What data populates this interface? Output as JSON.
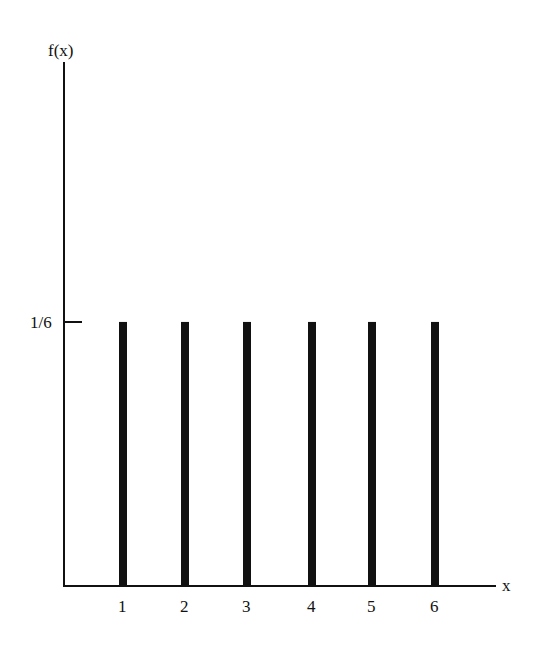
{
  "chart_data": {
    "type": "bar",
    "title": "",
    "xlabel": "x",
    "ylabel": "f(x)",
    "categories": [
      "1",
      "2",
      "3",
      "4",
      "5",
      "6"
    ],
    "values": [
      0.1667,
      0.1667,
      0.1667,
      0.1667,
      0.1667,
      0.1667
    ],
    "y_tick_labels": [
      "1/6"
    ],
    "x_tick_labels": [
      "1",
      "2",
      "3",
      "4",
      "5",
      "6"
    ],
    "ylim": [
      0,
      0.4
    ],
    "grid": false,
    "legend": null
  },
  "axes": {
    "y_label": "f(x)",
    "x_label": "x",
    "y_tick": "1/6"
  }
}
